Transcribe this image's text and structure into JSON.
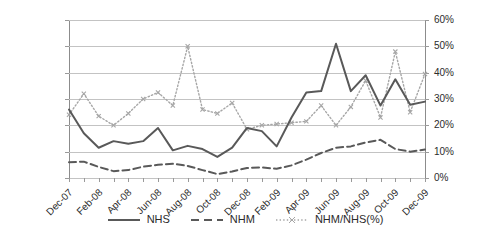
{
  "chart_data": {
    "type": "line",
    "title": "",
    "xlabel": "",
    "ylabel": "",
    "grid": true,
    "legend_position": "bottom",
    "x": [
      "Dec-07",
      "Jan-08",
      "Feb-08",
      "Mar-08",
      "Apr-08",
      "May-08",
      "Jun-08",
      "Jul-08",
      "Aug-08",
      "Sep-08",
      "Oct-08",
      "Nov-08",
      "Dec-08",
      "Jan-09",
      "Feb-09",
      "Mar-09",
      "Apr-09",
      "May-09",
      "Jun-09",
      "Jul-09",
      "Aug-09",
      "Sep-09",
      "Oct-09",
      "Nov-09",
      "Dec-09"
    ],
    "x_tick_labels": [
      "Dec-07",
      "Feb-08",
      "Apr-08",
      "Jun-08",
      "Aug-08",
      "Oct-08",
      "Dec-08",
      "Feb-09",
      "Apr-09",
      "Jun-09",
      "Aug-09",
      "Oct-09",
      "Dec-09"
    ],
    "axes": [
      {
        "id": "left",
        "side": "left",
        "ylim": [
          0,
          6000000
        ],
        "ytick_values": [
          0,
          1000000,
          2000000,
          3000000,
          4000000,
          5000000,
          6000000
        ],
        "ytick_labels": [
          "0",
          "1,000,000",
          "2,000,000",
          "3,000,000",
          "4,000,000",
          "5,000,000",
          "6,000,000"
        ]
      },
      {
        "id": "right",
        "side": "right",
        "ylim": [
          0,
          0.6
        ],
        "ytick_values": [
          0,
          0.1,
          0.2,
          0.3,
          0.4,
          0.5,
          0.6
        ],
        "ytick_labels": [
          "0%",
          "10%",
          "20%",
          "30%",
          "40%",
          "50%",
          "60%"
        ]
      }
    ],
    "series": [
      {
        "name": "NHS",
        "axis": "left",
        "style": "solid",
        "color": "#595959",
        "values": [
          2600000,
          1700000,
          1150000,
          1400000,
          1300000,
          1400000,
          1900000,
          1050000,
          1220000,
          1100000,
          800000,
          1150000,
          1900000,
          1780000,
          1200000,
          2300000,
          3250000,
          3300000,
          5100000,
          3300000,
          3900000,
          2750000,
          3750000,
          2780000,
          2900000
        ]
      },
      {
        "name": "NHM",
        "axis": "left",
        "style": "dashed",
        "color": "#595959",
        "values": [
          600000,
          620000,
          420000,
          260000,
          300000,
          430000,
          500000,
          540000,
          460000,
          300000,
          150000,
          250000,
          380000,
          400000,
          350000,
          480000,
          700000,
          950000,
          1150000,
          1200000,
          1350000,
          1450000,
          1100000,
          1000000,
          1080000
        ]
      },
      {
        "name": "NHM/NHS(%)",
        "axis": "right",
        "style": "dotted",
        "color": "#a6a6a6",
        "values": [
          0.24,
          0.32,
          0.235,
          0.2,
          0.245,
          0.3,
          0.325,
          0.275,
          0.5,
          0.26,
          0.245,
          0.285,
          0.185,
          0.2,
          0.205,
          0.21,
          0.215,
          0.275,
          0.2,
          0.27,
          0.37,
          0.23,
          0.48,
          0.25,
          0.395
        ]
      }
    ]
  },
  "legend": {
    "items": [
      {
        "label": "NHS",
        "style": "solid"
      },
      {
        "label": "NHM",
        "style": "dashed"
      },
      {
        "label": "NHM/NHS(%)",
        "style": "dotted"
      }
    ]
  }
}
